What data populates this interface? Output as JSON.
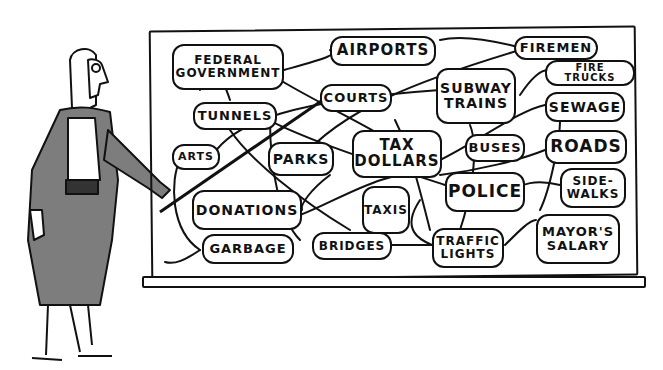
{
  "cartoon": {
    "board_nodes": [
      {
        "id": "federal",
        "label": "FEDERAL\nGOVERNMENT",
        "x": 172,
        "y": 44,
        "w": 112,
        "h": 46,
        "size": 12
      },
      {
        "id": "airports",
        "label": "AIRPORTS",
        "x": 330,
        "y": 36,
        "w": 106,
        "h": 30,
        "size": 15
      },
      {
        "id": "firemen",
        "label": "FIREMEN",
        "x": 514,
        "y": 36,
        "w": 84,
        "h": 24,
        "size": 13
      },
      {
        "id": "firetrucks",
        "label": "FIRE TRUCKS",
        "x": 545,
        "y": 60,
        "w": 90,
        "h": 26,
        "size": 10
      },
      {
        "id": "courts",
        "label": "COURTS",
        "x": 320,
        "y": 84,
        "w": 72,
        "h": 28,
        "size": 13
      },
      {
        "id": "subway",
        "label": "SUBWAY\nTRAINS",
        "x": 436,
        "y": 68,
        "w": 80,
        "h": 56,
        "size": 14
      },
      {
        "id": "tunnels",
        "label": "TUNNELS",
        "x": 193,
        "y": 102,
        "w": 84,
        "h": 28,
        "size": 13
      },
      {
        "id": "sewage",
        "label": "SEWAGE",
        "x": 545,
        "y": 92,
        "w": 80,
        "h": 30,
        "size": 14
      },
      {
        "id": "arts",
        "label": "ARTS",
        "x": 172,
        "y": 144,
        "w": 48,
        "h": 26,
        "size": 11
      },
      {
        "id": "parks",
        "label": "PARKS",
        "x": 268,
        "y": 142,
        "w": 66,
        "h": 34,
        "size": 14
      },
      {
        "id": "taxdollars",
        "label": "TAX\nDOLLARS",
        "x": 352,
        "y": 130,
        "w": 90,
        "h": 48,
        "size": 15
      },
      {
        "id": "buses",
        "label": "BUSES",
        "x": 465,
        "y": 134,
        "w": 60,
        "h": 28,
        "size": 13
      },
      {
        "id": "roads",
        "label": "ROADS",
        "x": 545,
        "y": 130,
        "w": 82,
        "h": 34,
        "size": 17
      },
      {
        "id": "taxis",
        "label": "TAXIS",
        "x": 362,
        "y": 186,
        "w": 48,
        "h": 48,
        "size": 12
      },
      {
        "id": "police",
        "label": "POLICE",
        "x": 445,
        "y": 172,
        "w": 80,
        "h": 40,
        "size": 17
      },
      {
        "id": "sidewalks",
        "label": "SIDE-\nWALKS",
        "x": 560,
        "y": 168,
        "w": 66,
        "h": 40,
        "size": 12
      },
      {
        "id": "donations",
        "label": "DONATIONS",
        "x": 192,
        "y": 190,
        "w": 110,
        "h": 40,
        "size": 14
      },
      {
        "id": "garbage",
        "label": "GARBAGE",
        "x": 202,
        "y": 234,
        "w": 92,
        "h": 30,
        "size": 13
      },
      {
        "id": "bridges",
        "label": "BRIDGES",
        "x": 312,
        "y": 232,
        "w": 80,
        "h": 28,
        "size": 12
      },
      {
        "id": "trafficlights",
        "label": "TRAFFIC\nLIGHTS",
        "x": 432,
        "y": 228,
        "w": 72,
        "h": 40,
        "size": 12
      },
      {
        "id": "mayorssalary",
        "label": "MAYOR'S\nSALARY",
        "x": 536,
        "y": 214,
        "w": 84,
        "h": 50,
        "size": 13
      }
    ],
    "figure": {
      "description": "woman with glasses and long hair pointing at the board with a stick",
      "dress_color": "#7d7d7d"
    },
    "colors": {
      "ink": "#111111",
      "paper": "#ffffff",
      "dress": "#7d7d7d"
    }
  }
}
